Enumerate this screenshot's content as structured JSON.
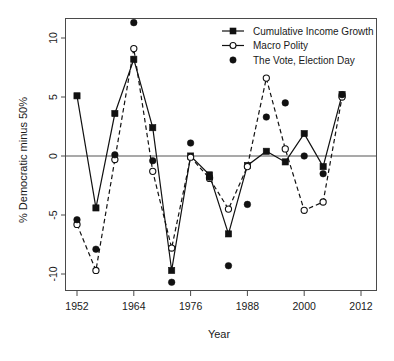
{
  "chart_data": {
    "type": "line",
    "title": "",
    "xlabel": "Year",
    "ylabel": "% Democratic minus 50%",
    "xlim": [
      1948,
      2016
    ],
    "ylim": [
      -12.6,
      12.4
    ],
    "xticks": [
      1952,
      1964,
      1976,
      1988,
      2000,
      2012
    ],
    "yticks": [
      10,
      5,
      0,
      -5,
      -10
    ],
    "xtick_labels": [
      "1952",
      "1964",
      "1976",
      "1988",
      "2000",
      "2012"
    ],
    "ytick_labels": [
      "10",
      "5",
      "0",
      "-5",
      "-10"
    ],
    "grid": false,
    "zero_reference_line": 0,
    "legend_position": "top-right",
    "x": [
      1952,
      1956,
      1960,
      1964,
      1968,
      1972,
      1976,
      1980,
      1984,
      1988,
      1992,
      1996,
      2000,
      2004,
      2008
    ],
    "series": [
      {
        "name": "Cumulative Income Growth",
        "marker": "filled-square",
        "linestyle": "solid",
        "color": "#111111",
        "values": [
          5.1,
          -4.4,
          3.6,
          8.2,
          2.4,
          -9.7,
          0.0,
          -1.6,
          -6.6,
          -0.8,
          0.4,
          -0.5,
          1.9,
          -0.9,
          5.2
        ]
      },
      {
        "name": "Macro Polity",
        "marker": "open-circle",
        "linestyle": "dashed",
        "color": "#111111",
        "values": [
          -5.8,
          -9.7,
          -0.3,
          9.1,
          -1.3,
          -7.8,
          -0.1,
          -1.9,
          -4.5,
          -0.9,
          6.6,
          0.6,
          -4.6,
          -3.9,
          5.0
        ]
      },
      {
        "name": "The Vote, Election Day",
        "marker": "filled-dot",
        "linestyle": "none",
        "color": "#111111",
        "values": [
          -5.4,
          -7.9,
          0.1,
          11.3,
          -0.4,
          -10.7,
          1.1,
          -1.8,
          -9.3,
          -4.1,
          3.3,
          4.5,
          0.0,
          -1.5,
          5.2
        ]
      }
    ]
  },
  "legend": {
    "entries": [
      {
        "label": "Cumulative Income Growth",
        "glyph": "line-square-icon"
      },
      {
        "label": "Macro Polity",
        "glyph": "line-circle-icon"
      },
      {
        "label": "The Vote, Election Day",
        "glyph": "dot-icon"
      }
    ]
  }
}
